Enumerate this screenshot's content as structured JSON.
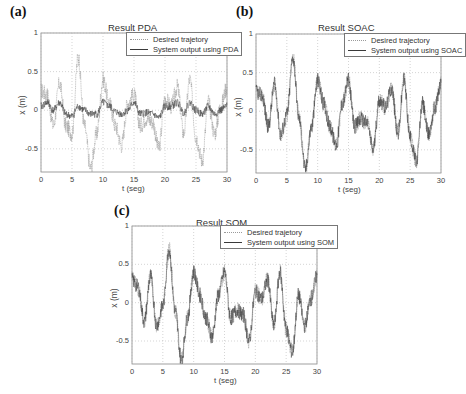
{
  "figure": {
    "panels": [
      {
        "label": "(a)",
        "title": "Result PDA",
        "xlabel": "t (seg)",
        "ylabel": "x (m)",
        "legend": [
          "Desired trajetory",
          "System output using PDA"
        ]
      },
      {
        "label": "(b)",
        "title": "Result SOAC",
        "xlabel": "t (seg)",
        "ylabel": "x (m)",
        "legend": [
          "Desired trajectory",
          "System output using SOAC"
        ]
      },
      {
        "label": "(c)",
        "title": "Result SOM",
        "xlabel": "t (seg)",
        "ylabel": "x (m)",
        "legend": [
          "Desired trajetory",
          "System output using SOM"
        ]
      }
    ],
    "xticks": [
      "0",
      "5",
      "10",
      "15",
      "20",
      "25",
      "30"
    ],
    "yticks": [
      "1",
      "0.5",
      "0",
      "-0.5",
      ""
    ],
    "colors": {
      "desired": "#9a9a9a",
      "output": "#3a3a3a",
      "grid": "#b8b8b8",
      "axis": "#888888"
    }
  },
  "chart_data": [
    {
      "type": "line",
      "title": "Result PDA",
      "panel_label": "(a)",
      "xlabel": "t (seg)",
      "ylabel": "x (m)",
      "xlim": [
        0,
        30
      ],
      "ylim": [
        -0.8,
        1
      ],
      "grid": true,
      "legend_position": "upper right",
      "x": [
        0,
        1,
        2,
        3,
        4,
        5,
        6,
        7,
        8,
        9,
        10,
        11,
        12,
        13,
        14,
        15,
        16,
        17,
        18,
        19,
        20,
        21,
        22,
        23,
        24,
        25,
        26,
        27,
        28,
        29,
        30
      ],
      "series": [
        {
          "name": "Desired trajetory",
          "values": [
            0.25,
            0.2,
            -0.2,
            0.35,
            -0.2,
            -0.3,
            0.7,
            -0.2,
            -0.75,
            -0.3,
            0.4,
            0.1,
            -0.2,
            -0.45,
            0.1,
            0.2,
            -0.2,
            -0.1,
            -0.15,
            -0.5,
            0.15,
            0.05,
            0.3,
            -0.3,
            0.4,
            -0.35,
            -0.65,
            0.1,
            -0.3,
            0.05,
            0.3
          ]
        },
        {
          "name": "System output using PDA",
          "values": [
            0.05,
            0.1,
            0.0,
            0.1,
            -0.05,
            -0.08,
            0.05,
            0.0,
            -0.05,
            -0.05,
            0.1,
            0.05,
            -0.02,
            -0.05,
            0.0,
            0.1,
            -0.05,
            -0.03,
            -0.05,
            -0.1,
            0.05,
            0.05,
            0.1,
            -0.03,
            0.1,
            0.0,
            -0.05,
            0.05,
            -0.05,
            0.0,
            0.05
          ]
        }
      ]
    },
    {
      "type": "line",
      "title": "Result SOAC",
      "panel_label": "(b)",
      "xlabel": "t (seg)",
      "ylabel": "x (m)",
      "xlim": [
        0,
        30
      ],
      "ylim": [
        -0.8,
        1
      ],
      "grid": true,
      "legend_position": "upper right",
      "x": [
        0,
        1,
        2,
        3,
        4,
        5,
        6,
        7,
        8,
        9,
        10,
        11,
        12,
        13,
        14,
        15,
        16,
        17,
        18,
        19,
        20,
        21,
        22,
        23,
        24,
        25,
        26,
        27,
        28,
        29,
        30
      ],
      "series": [
        {
          "name": "Desired trajectory",
          "values": [
            0.25,
            0.2,
            -0.2,
            0.35,
            -0.3,
            -0.05,
            0.7,
            -0.1,
            -0.75,
            -0.2,
            0.4,
            0.1,
            -0.2,
            -0.45,
            0.1,
            0.4,
            -0.2,
            -0.1,
            -0.15,
            -0.5,
            0.15,
            0.05,
            0.3,
            -0.3,
            0.4,
            -0.35,
            -0.65,
            0.1,
            -0.3,
            0.05,
            0.35
          ]
        },
        {
          "name": "System output using SOAC",
          "values": [
            0.25,
            0.2,
            -0.2,
            0.35,
            -0.3,
            -0.05,
            0.7,
            -0.1,
            -0.75,
            -0.2,
            0.4,
            0.1,
            -0.2,
            -0.45,
            0.1,
            0.4,
            -0.2,
            -0.1,
            -0.15,
            -0.5,
            0.15,
            0.05,
            0.3,
            -0.3,
            0.4,
            -0.35,
            -0.65,
            0.1,
            -0.3,
            0.05,
            0.35
          ]
        }
      ]
    },
    {
      "type": "line",
      "title": "Result SOM",
      "panel_label": "(c)",
      "xlabel": "t (seg)",
      "ylabel": "x (m)",
      "xlim": [
        0,
        30
      ],
      "ylim": [
        -0.8,
        1
      ],
      "grid": true,
      "legend_position": "upper right",
      "x": [
        0,
        1,
        2,
        3,
        4,
        5,
        6,
        7,
        8,
        9,
        10,
        11,
        12,
        13,
        14,
        15,
        16,
        17,
        18,
        19,
        20,
        21,
        22,
        23,
        24,
        25,
        26,
        27,
        28,
        29,
        30
      ],
      "series": [
        {
          "name": "Desired trajetory",
          "values": [
            0.3,
            0.2,
            -0.25,
            0.35,
            -0.3,
            -0.05,
            0.7,
            -0.1,
            -0.75,
            -0.2,
            0.4,
            0.1,
            -0.2,
            -0.45,
            0.1,
            0.4,
            -0.2,
            -0.1,
            -0.15,
            -0.5,
            0.15,
            0.05,
            0.3,
            -0.3,
            0.4,
            -0.35,
            -0.65,
            0.1,
            -0.3,
            0.05,
            0.35
          ]
        },
        {
          "name": "System output using SOM",
          "values": [
            0.3,
            0.2,
            -0.25,
            0.35,
            -0.3,
            -0.05,
            0.7,
            -0.1,
            -0.75,
            -0.2,
            0.4,
            0.1,
            -0.2,
            -0.45,
            0.1,
            0.4,
            -0.2,
            -0.1,
            -0.15,
            -0.5,
            0.15,
            0.05,
            0.3,
            -0.3,
            0.4,
            -0.35,
            -0.65,
            0.1,
            -0.3,
            0.05,
            0.35
          ]
        }
      ]
    }
  ]
}
